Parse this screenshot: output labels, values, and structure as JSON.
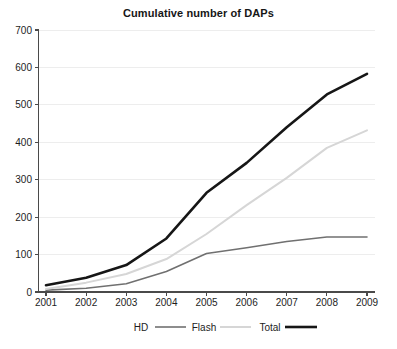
{
  "chart_data": {
    "type": "line",
    "title": "Cumulative number of DAPs",
    "xlabel": "",
    "ylabel": "",
    "x": [
      "2001",
      "2002",
      "2003",
      "2004",
      "2005",
      "2006",
      "2007",
      "2008",
      "2009"
    ],
    "categories": [
      "2001",
      "2002",
      "2003",
      "2004",
      "2005",
      "2006",
      "2007",
      "2008",
      "2009"
    ],
    "xlim": [
      2001,
      2009
    ],
    "ylim": [
      0,
      700
    ],
    "yticks": [
      0,
      100,
      200,
      300,
      400,
      500,
      600,
      700
    ],
    "ytick_labels": [
      "0",
      "100",
      "200",
      "300",
      "400",
      "500",
      "600",
      "700"
    ],
    "xtick_labels": [
      "2001",
      "2002",
      "2003",
      "2004",
      "2005",
      "2006",
      "2007",
      "2008",
      "2009"
    ],
    "grid": "horizontal",
    "legend_position": "bottom",
    "series": [
      {
        "name": "HD",
        "color": "#707070",
        "width": 1.6,
        "values": [
          5,
          10,
          22,
          55,
          103,
          118,
          135,
          147,
          147
        ]
      },
      {
        "name": "Flash",
        "color": "#d6d6d6",
        "width": 2.0,
        "values": [
          8,
          25,
          48,
          88,
          155,
          232,
          305,
          385,
          432
        ]
      },
      {
        "name": "Total",
        "color": "#161616",
        "width": 2.6,
        "values": [
          18,
          38,
          72,
          143,
          265,
          345,
          440,
          528,
          583
        ]
      }
    ]
  },
  "legend": {
    "items": [
      {
        "label": "HD",
        "color": "#707070",
        "width": 1.6
      },
      {
        "label": "Flash",
        "color": "#d6d6d6",
        "width": 2.0
      },
      {
        "label": "Total",
        "color": "#161616",
        "width": 2.6
      }
    ]
  },
  "axes": {
    "y_axis_color": "#4a4a4a",
    "x_axis_color": "#4a4a4a",
    "grid_color": "#ededed"
  }
}
